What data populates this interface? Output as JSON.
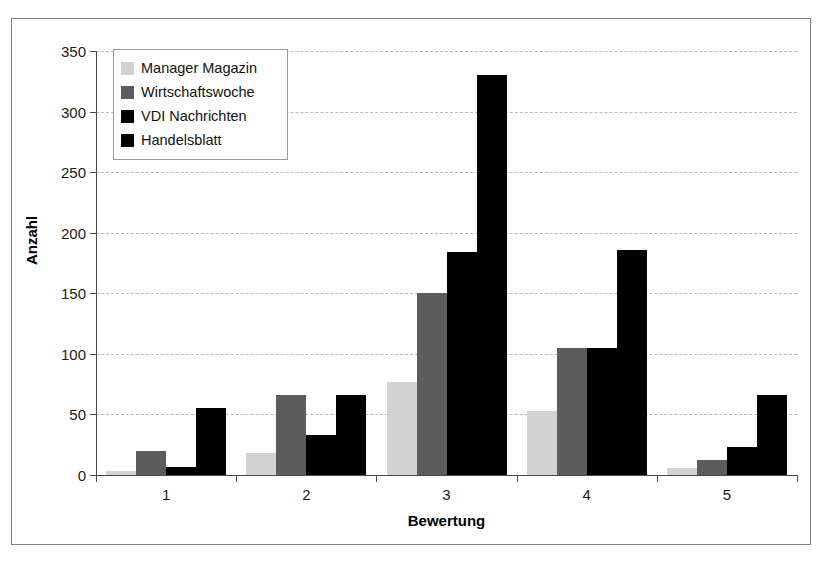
{
  "chart_data": {
    "type": "bar",
    "title": "",
    "xlabel": "Bewertung",
    "ylabel": "Anzahl",
    "categories": [
      "1",
      "2",
      "3",
      "4",
      "5"
    ],
    "ylim": [
      0,
      350
    ],
    "yticks": [
      0,
      50,
      100,
      150,
      200,
      250,
      300,
      350
    ],
    "ytick_labels": [
      "0",
      "50",
      "100",
      "150",
      "200",
      "250",
      "300",
      "350"
    ],
    "grid": true,
    "legend_position": "upper left",
    "series": [
      {
        "name": "Manager Magazin",
        "color": "#d2d2d2",
        "values": [
          3,
          18,
          77,
          53,
          6
        ]
      },
      {
        "name": "Wirtschaftswoche",
        "color": "#5c5c5c",
        "values": [
          20,
          66,
          150,
          105,
          12
        ]
      },
      {
        "name": "VDI Nachrichten",
        "color": "#000000",
        "values": [
          7,
          33,
          184,
          105,
          23
        ]
      },
      {
        "name": "Handelsblatt",
        "color": "#000000",
        "values": [
          55,
          66,
          330,
          186,
          66
        ]
      }
    ]
  },
  "legend": {
    "items": [
      {
        "label": "Manager Magazin"
      },
      {
        "label": "Wirtschaftswoche"
      },
      {
        "label": "VDI Nachrichten"
      },
      {
        "label": "Handelsblatt"
      }
    ]
  },
  "axes": {
    "y_title": "Anzahl",
    "x_title": "Bewertung"
  }
}
